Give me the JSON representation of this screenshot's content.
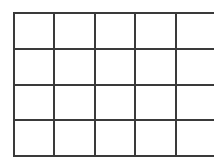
{
  "canvas": {
    "width": 214,
    "height": 164,
    "background_color": "#ffffff"
  },
  "grid": {
    "kind": "empty-grid",
    "rows": 4,
    "columns": 5,
    "origin_x": 13,
    "origin_y": 12,
    "width": 192,
    "height": 143,
    "cell_width": 38.4,
    "cell_height": 35.75,
    "line_color": "#3a3a3a",
    "line_width": 2,
    "cell_fill": "#ffffff",
    "cells": [
      [
        "",
        "",
        "",
        "",
        ""
      ],
      [
        "",
        "",
        "",
        "",
        ""
      ],
      [
        "",
        "",
        "",
        "",
        ""
      ],
      [
        "",
        "",
        "",
        "",
        ""
      ]
    ]
  },
  "chart_data": {
    "type": "table",
    "title": "",
    "xlabel": "",
    "ylabel": "",
    "columns": 5,
    "rows": 4,
    "column_headers": [
      "",
      "",
      "",
      "",
      ""
    ],
    "values": [
      [
        "",
        "",
        "",
        "",
        ""
      ],
      [
        "",
        "",
        "",
        "",
        ""
      ],
      [
        "",
        "",
        "",
        "",
        ""
      ],
      [
        "",
        "",
        "",
        "",
        ""
      ]
    ],
    "grid": true,
    "legend": "none"
  }
}
